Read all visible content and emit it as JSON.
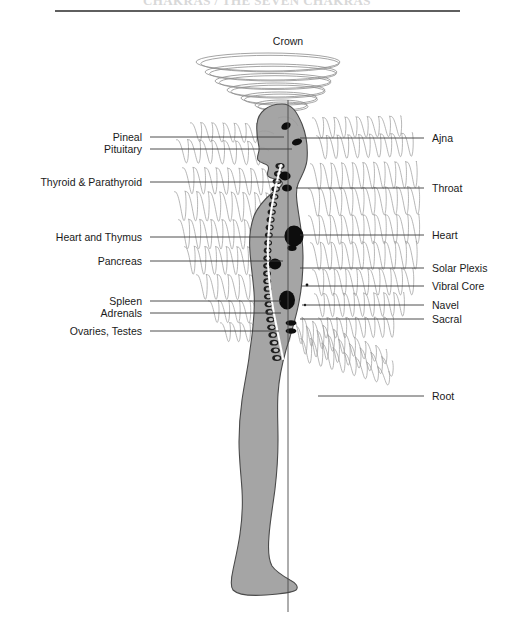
{
  "title": "CHAKRAS / THE SEVEN CHAKRAS",
  "crown": {
    "label": "Crown"
  },
  "left_labels": [
    {
      "id": "pineal",
      "label": "Pineal",
      "y": 137,
      "text_x": 142,
      "line_x1": 150,
      "line_x2": 284
    },
    {
      "id": "pituitary",
      "label": "Pituitary",
      "y": 149,
      "text_x": 142,
      "line_x1": 150,
      "line_x2": 292
    },
    {
      "id": "thyroid",
      "label": "Thyroid & Parathyroid",
      "y": 182,
      "text_x": 142,
      "line_x1": 150,
      "line_x2": 282
    },
    {
      "id": "heart-thymus",
      "label": "Heart and Thymus",
      "y": 237,
      "text_x": 142,
      "line_x1": 150,
      "line_x2": 285
    },
    {
      "id": "pancreas",
      "label": "Pancreas",
      "y": 261,
      "text_x": 142,
      "line_x1": 150,
      "line_x2": 283
    },
    {
      "id": "spleen",
      "label": "Spleen",
      "y": 301,
      "text_x": 142,
      "line_x1": 150,
      "line_x2": 281
    },
    {
      "id": "adrenals",
      "label": "Adrenals",
      "y": 313,
      "text_x": 142,
      "line_x1": 150,
      "line_x2": 281
    },
    {
      "id": "ovaries-testes",
      "label": "Ovaries, Testes",
      "y": 331,
      "text_x": 142,
      "line_x1": 150,
      "line_x2": 279
    }
  ],
  "right_labels": [
    {
      "id": "ajna",
      "label": "Ajna",
      "y": 138,
      "text_x": 432,
      "line_x1": 300,
      "line_x2": 424
    },
    {
      "id": "throat",
      "label": "Throat",
      "y": 188,
      "text_x": 432,
      "line_x1": 296,
      "line_x2": 424
    },
    {
      "id": "heart",
      "label": "Heart",
      "y": 235,
      "text_x": 432,
      "line_x1": 300,
      "line_x2": 424
    },
    {
      "id": "solar-plexis",
      "label": "Solar Plexis",
      "y": 268,
      "text_x": 432,
      "line_x1": 300,
      "line_x2": 424
    },
    {
      "id": "vibral-core",
      "label": "Vibral Core",
      "y": 286,
      "text_x": 432,
      "line_x1": 302,
      "line_x2": 424
    },
    {
      "id": "navel",
      "label": "Navel",
      "y": 305,
      "text_x": 432,
      "line_x1": 302,
      "line_x2": 424
    },
    {
      "id": "sacral",
      "label": "Sacral",
      "y": 319,
      "text_x": 432,
      "line_x1": 300,
      "line_x2": 424
    },
    {
      "id": "root",
      "label": "Root",
      "y": 396,
      "text_x": 432,
      "line_x1": 318,
      "line_x2": 424
    }
  ],
  "chakra_points": [
    {
      "id": "pineal-mark",
      "cx": 286,
      "cy": 126,
      "rx": 5.0,
      "ry": 3.4,
      "rot": -30
    },
    {
      "id": "pituitary-mark",
      "cx": 297,
      "cy": 142,
      "rx": 5.2,
      "ry": 3.2,
      "rot": -18
    },
    {
      "id": "throat-upper",
      "cx": 285,
      "cy": 176,
      "rx": 5.6,
      "ry": 4.4,
      "rot": 0
    },
    {
      "id": "throat-lower",
      "cx": 287,
      "cy": 188,
      "rx": 5.0,
      "ry": 3.6,
      "rot": 0
    },
    {
      "id": "heart-mark",
      "cx": 294,
      "cy": 236,
      "rx": 9.6,
      "ry": 10.4,
      "rot": 0
    },
    {
      "id": "heart-tail",
      "cx": 292,
      "cy": 248,
      "rx": 4.6,
      "ry": 3.0,
      "rot": 0
    },
    {
      "id": "solar-mark",
      "cx": 275,
      "cy": 264,
      "rx": 6.2,
      "ry": 5.4,
      "rot": 0
    },
    {
      "id": "navel-mark",
      "cx": 287,
      "cy": 300,
      "rx": 8.0,
      "ry": 9.6,
      "rot": 0
    },
    {
      "id": "sacral-upper",
      "cx": 291,
      "cy": 323,
      "rx": 5.4,
      "ry": 2.8,
      "rot": 0
    },
    {
      "id": "sacral-lower",
      "cx": 291,
      "cy": 331,
      "rx": 5.4,
      "ry": 2.8,
      "rot": 0
    },
    {
      "id": "vibral-dot-1",
      "cx": 307,
      "cy": 285,
      "rx": 1.4,
      "ry": 1.4,
      "rot": 0
    },
    {
      "id": "vibral-dot-2",
      "cx": 305,
      "cy": 305,
      "rx": 1.2,
      "ry": 1.2,
      "rot": 0
    }
  ],
  "crown_rings": [
    {
      "cx": 268,
      "cy": 62,
      "rx": 72,
      "ry": 9
    },
    {
      "cx": 271,
      "cy": 72,
      "rx": 66,
      "ry": 8
    },
    {
      "cx": 273,
      "cy": 81,
      "rx": 58,
      "ry": 7.5
    },
    {
      "cx": 276,
      "cy": 90,
      "rx": 49,
      "ry": 7
    },
    {
      "cx": 279,
      "cy": 98,
      "rx": 38,
      "ry": 6
    },
    {
      "cx": 281,
      "cy": 105,
      "rx": 26,
      "ry": 5
    }
  ],
  "colors": {
    "body": "#a5a5a5",
    "outline": "#4a4a4a",
    "aura": "#9a9a9a",
    "chakra": "#0d0d0d",
    "text": "#1a1a1a",
    "background": "#ffffff"
  }
}
